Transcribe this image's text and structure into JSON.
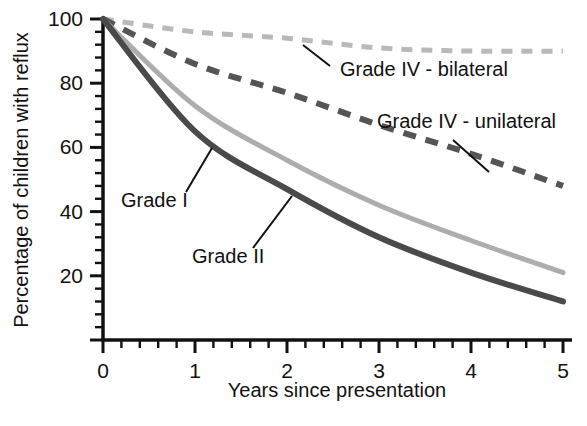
{
  "chart_data": {
    "type": "line",
    "title": "",
    "xlabel": "Years since presentation",
    "ylabel": "Percentage of children with reflux",
    "xlim": [
      0,
      5
    ],
    "ylim": [
      0,
      100
    ],
    "x_ticks": [
      "0",
      "1",
      "2",
      "3",
      "4",
      "5"
    ],
    "y_ticks": [
      "20",
      "40",
      "60",
      "80",
      "100"
    ],
    "x_minor_ticks_per_interval": 5,
    "y_minor_ticks_per_interval": 4,
    "grid": false,
    "legend": "inline-annotations",
    "x": [
      0,
      1,
      2,
      3,
      4,
      5
    ],
    "series": [
      {
        "name": "Grade IV - bilateral",
        "values": [
          100,
          96,
          94,
          91,
          90,
          90
        ],
        "color": "#b9b9b9",
        "style": "dashed",
        "width": 5,
        "dash": "11,9"
      },
      {
        "name": "Grade IV - unilateral",
        "values": [
          100,
          86,
          77,
          67,
          58,
          48
        ],
        "color": "#555555",
        "style": "dashed",
        "width": 6,
        "dash": "13,10"
      },
      {
        "name": "Grade I",
        "values": [
          100,
          73,
          56,
          42,
          31,
          21
        ],
        "color": "#adadad",
        "style": "solid",
        "width": 5,
        "dash": ""
      },
      {
        "name": "Grade II",
        "values": [
          100,
          65,
          47,
          32,
          21,
          12
        ],
        "color": "#4a4a4a",
        "style": "solid",
        "width": 6,
        "dash": ""
      }
    ],
    "annotations": [
      {
        "text": "Grade IV - bilateral",
        "label_x": 340,
        "label_y": 76,
        "anchor": "start",
        "leader": [
          330,
          66,
          303,
          45
        ]
      },
      {
        "text": "Grade IV - unilateral",
        "label_x": 377,
        "label_y": 128,
        "anchor": "start",
        "leader": [
          453,
          140,
          489,
          172
        ]
      },
      {
        "text": "Grade I",
        "label_x": 121,
        "label_y": 207,
        "anchor": "start",
        "leader": [
          186,
          192,
          212,
          148
        ]
      },
      {
        "text": "Grade II",
        "label_x": 192,
        "label_y": 263,
        "anchor": "start",
        "leader": [
          253,
          248,
          292,
          196
        ]
      }
    ]
  },
  "axis": {
    "color": "#111111",
    "tick_color": "#111111"
  }
}
